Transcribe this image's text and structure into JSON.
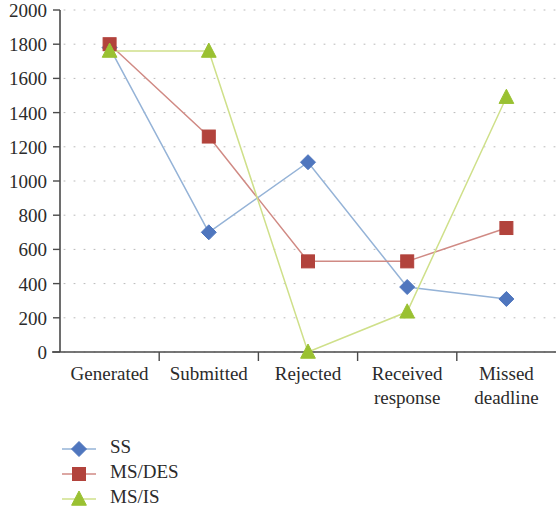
{
  "chart_data": {
    "type": "line",
    "title": "",
    "xlabel": "",
    "ylabel": "",
    "categories": [
      "Generated",
      "Submitted",
      "Rejected",
      "Received response",
      "Missed deadline"
    ],
    "category_lines": [
      [
        "Generated"
      ],
      [
        "Submitted"
      ],
      [
        "Rejected"
      ],
      [
        "Received",
        "response"
      ],
      [
        "Missed",
        "deadline"
      ]
    ],
    "series": [
      {
        "name": "SS",
        "color": "#4f76be",
        "line_color": "#95b3d7",
        "marker": "diamond",
        "values": [
          1780,
          700,
          1110,
          380,
          310
        ]
      },
      {
        "name": "MS/DES",
        "color": "#b2433c",
        "line_color": "#d08a84",
        "marker": "square",
        "values": [
          1800,
          1260,
          530,
          530,
          725
        ]
      },
      {
        "name": "MS/IS",
        "color": "#9ac132",
        "line_color": "#cfe08a",
        "marker": "triangle",
        "values": [
          1760,
          1760,
          0,
          235,
          1490
        ]
      }
    ],
    "ylim": [
      0,
      2000
    ],
    "ytick_step": 200,
    "yticks": [
      0,
      200,
      400,
      600,
      800,
      1000,
      1200,
      1400,
      1600,
      1800,
      2000
    ],
    "grid": true,
    "grid_style": "dotted-horizontal",
    "legend_position": "bottom-left"
  }
}
